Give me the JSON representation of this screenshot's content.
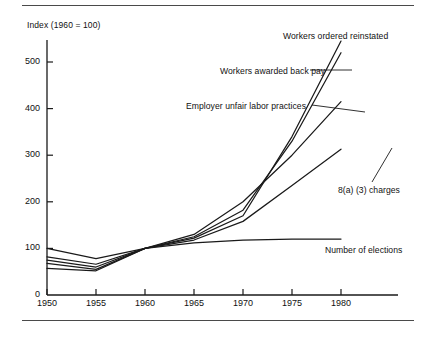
{
  "figure": {
    "axis_title": "Index (1960 = 100)",
    "caption": ""
  },
  "chart_data": {
    "type": "line",
    "title": "",
    "subtitle": "",
    "xlabel": "",
    "ylabel": "Index (1960 = 100)",
    "annotation": "Index (1960 = 100)",
    "x": [
      1950,
      1955,
      1960,
      1965,
      1970,
      1975,
      1980
    ],
    "xlim": [
      1950,
      1980
    ],
    "ylim": [
      0,
      560
    ],
    "xticks": [
      1950,
      1955,
      1960,
      1965,
      1970,
      1975,
      1980
    ],
    "xticklabels": [
      "1950",
      "1955",
      "1960",
      "1965",
      "1970",
      "1975",
      "1980"
    ],
    "yticks": [
      0,
      100,
      200,
      300,
      400,
      500
    ],
    "yticklabels": [
      "0",
      "100",
      "200",
      "300",
      "400",
      "500"
    ],
    "grid": false,
    "legend": "inline-labels-right",
    "line_color": "#1a1a1a",
    "series": [
      {
        "name": "Workers ordered reinstated",
        "values": [
          57,
          52,
          100,
          122,
          170,
          340,
          545
        ],
        "label_x": 283,
        "label_y": 31,
        "leader": false
      },
      {
        "name": "Workers awarded back pay",
        "values": [
          75,
          60,
          100,
          125,
          182,
          330,
          520
        ],
        "label_x": 220,
        "label_y": 66,
        "leader": true
      },
      {
        "name": "Employer unfair labor practices",
        "values": [
          82,
          66,
          100,
          130,
          200,
          300,
          415
        ],
        "label_x": 186,
        "label_y": 101,
        "leader": true
      },
      {
        "name": "8(a) (3) charges",
        "values": [
          68,
          55,
          100,
          118,
          158,
          235,
          313
        ],
        "label_x": 338,
        "label_y": 185,
        "leader": true
      },
      {
        "name": "Number of elections",
        "values": [
          100,
          78,
          100,
          112,
          118,
          120,
          120
        ],
        "label_x": 325,
        "label_y": 245,
        "leader": false
      }
    ]
  }
}
